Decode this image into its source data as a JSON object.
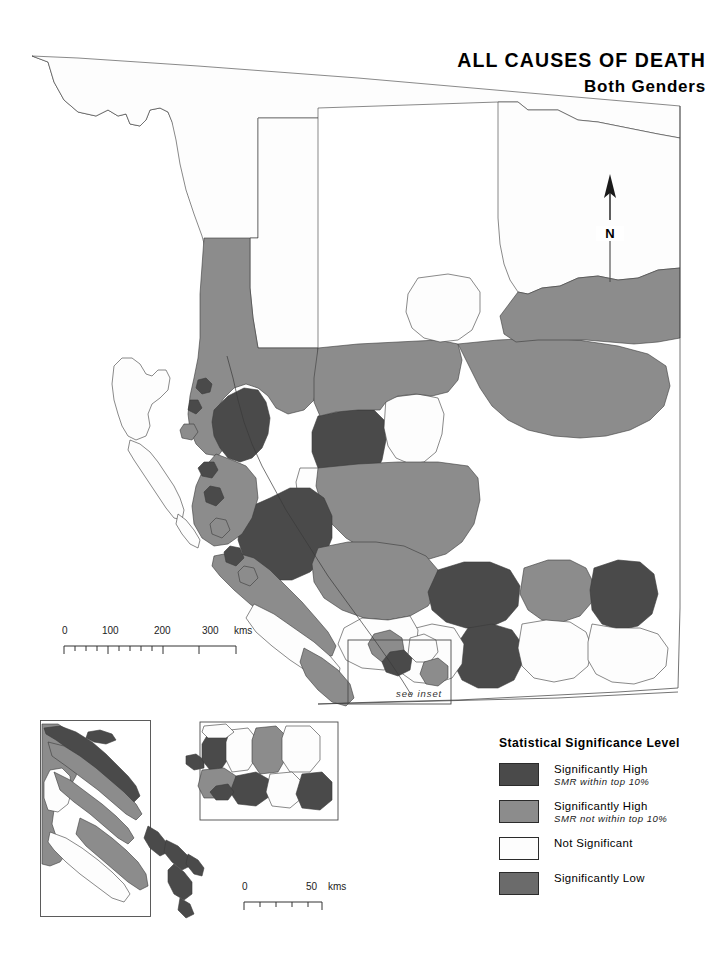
{
  "title": {
    "main": "ALL CAUSES OF DEATH",
    "sub": "Both Genders"
  },
  "north_arrow": {
    "label": "N",
    "icon": "north-arrow-icon"
  },
  "scalebar_main": {
    "ticks": [
      "0",
      "100",
      "200",
      "300"
    ],
    "units": "kms",
    "label_0": "0",
    "label_100": "100",
    "label_200": "200",
    "label_300": "300"
  },
  "scalebar_inset": {
    "ticks": [
      "0",
      "50"
    ],
    "units": "kms",
    "label_0": "0",
    "label_50": "50"
  },
  "inset_callout": {
    "label": "see inset"
  },
  "legend": {
    "title": "Statistical Significance Level",
    "items": [
      {
        "label": "Significantly High",
        "note": "SMR within top 10%",
        "color": "#4a4a4a"
      },
      {
        "label": "Significantly High",
        "note": "SMR not within top 10%",
        "color": "#8c8c8c"
      },
      {
        "label": "Not Significant",
        "note": "",
        "color": "#fdfdfd"
      },
      {
        "label": "Significantly Low",
        "note": "",
        "color": "#6b6b6b"
      }
    ]
  },
  "map": {
    "colors": {
      "high_top10": "#4a4a4a",
      "high": "#8c8c8c",
      "not_significant": "#fdfdfd",
      "low": "#6b6b6b",
      "outline": "#3a3a3a",
      "background": "#ffffff"
    },
    "region_name": "British Columbia health regions",
    "inset_region_name": "Vancouver Island and Lower Mainland inset"
  }
}
